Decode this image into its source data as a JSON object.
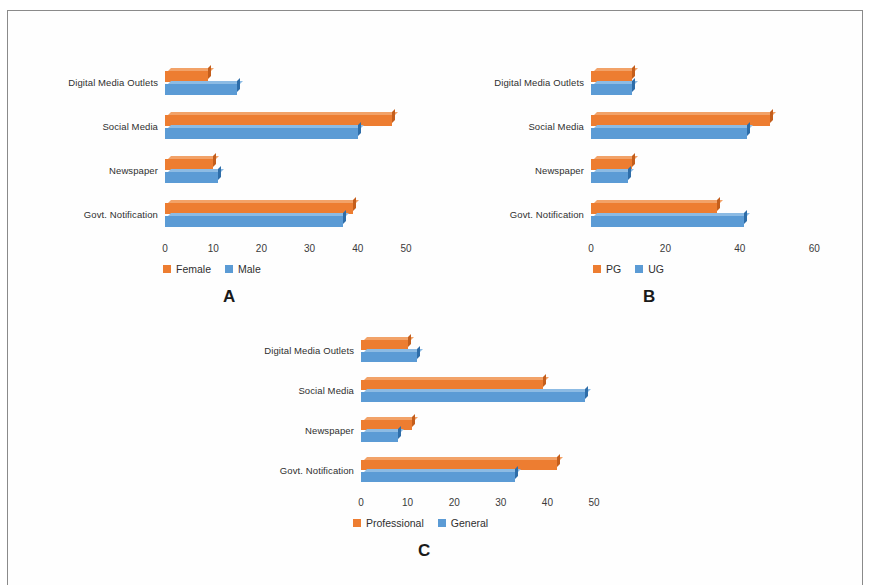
{
  "figure": {
    "panels": [
      "A",
      "B",
      "C"
    ],
    "categories": [
      "Govt. Notification",
      "Newspaper",
      "Social Media",
      "Digital Media Outlets"
    ],
    "colors": {
      "orange": "#ED7D31",
      "orange_top": "#F2A268",
      "orange_side": "#C45E1C",
      "blue": "#5B9BD5",
      "blue_top": "#8CBBE4",
      "blue_side": "#2E6DA8",
      "frame": "#8a8a8a",
      "text": "#2f2f2f"
    }
  },
  "chart_data": [
    {
      "type": "bar",
      "orientation": "horizontal",
      "panel": "A",
      "title": "",
      "xlabel": "",
      "ylabel": "",
      "categories": [
        "Govt. Notification",
        "Newspaper",
        "Social Media",
        "Digital Media Outlets"
      ],
      "ticks": [
        0,
        10,
        20,
        30,
        40,
        50
      ],
      "xlim": [
        0,
        50
      ],
      "grid": false,
      "legend_position": "bottom",
      "series": [
        {
          "name": "Female",
          "color": "#ED7D31",
          "values": [
            39,
            10,
            47,
            9
          ]
        },
        {
          "name": "Male",
          "color": "#5B9BD5",
          "values": [
            37,
            11,
            40,
            15
          ]
        }
      ]
    },
    {
      "type": "bar",
      "orientation": "horizontal",
      "panel": "B",
      "title": "",
      "xlabel": "",
      "ylabel": "",
      "categories": [
        "Govt. Notification",
        "Newspaper",
        "Social Media",
        "Digital Media Outlets"
      ],
      "ticks": [
        0,
        20,
        40,
        60
      ],
      "xlim": [
        0,
        60
      ],
      "grid": false,
      "legend_position": "bottom",
      "series": [
        {
          "name": "PG",
          "color": "#ED7D31",
          "values": [
            34,
            11,
            48,
            11
          ]
        },
        {
          "name": "UG",
          "color": "#5B9BD5",
          "values": [
            41,
            10,
            42,
            11
          ]
        }
      ]
    },
    {
      "type": "bar",
      "orientation": "horizontal",
      "panel": "C",
      "title": "",
      "xlabel": "",
      "ylabel": "",
      "categories": [
        "Govt. Notification",
        "Newspaper",
        "Social Media",
        "Digital Media Outlets"
      ],
      "ticks": [
        0,
        10,
        20,
        30,
        40,
        50
      ],
      "xlim": [
        0,
        50
      ],
      "grid": false,
      "legend_position": "bottom",
      "series": [
        {
          "name": "Professional",
          "color": "#ED7D31",
          "values": [
            42,
            11,
            39,
            10
          ]
        },
        {
          "name": "General",
          "color": "#5B9BD5",
          "values": [
            33,
            8,
            48,
            12
          ]
        }
      ]
    }
  ]
}
